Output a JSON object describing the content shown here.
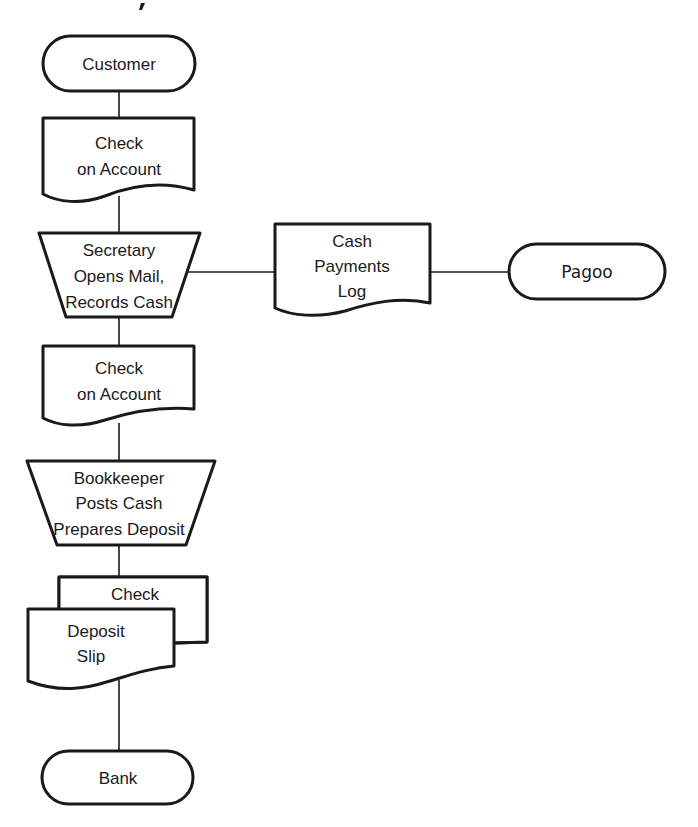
{
  "diagram": {
    "type": "flowchart",
    "nodes": [
      {
        "id": "customer",
        "shape": "terminator",
        "lines": [
          "Customer"
        ]
      },
      {
        "id": "check1",
        "shape": "document",
        "lines": [
          "Check",
          "on Account"
        ]
      },
      {
        "id": "secretary",
        "shape": "manual-operation",
        "lines": [
          "Secretary",
          "Opens Mail,",
          "Records Cash"
        ]
      },
      {
        "id": "cashlog",
        "shape": "document",
        "lines": [
          "Cash",
          "Payments",
          "Log"
        ]
      },
      {
        "id": "pagoo",
        "shape": "terminator",
        "lines": [
          "Pagoo"
        ]
      },
      {
        "id": "check2",
        "shape": "document",
        "lines": [
          "Check",
          "on Account"
        ]
      },
      {
        "id": "bookkeeper",
        "shape": "manual-operation",
        "lines": [
          "Bookkeeper",
          "Posts Cash",
          "Prepares Deposit"
        ]
      },
      {
        "id": "check3",
        "shape": "document-back",
        "lines": [
          "Check"
        ]
      },
      {
        "id": "depositslip",
        "shape": "document-front",
        "lines": [
          "Deposit",
          "Slip"
        ]
      },
      {
        "id": "bank",
        "shape": "terminator",
        "lines": [
          "Bank"
        ]
      }
    ],
    "edges": [
      {
        "from": "customer",
        "to": "check1"
      },
      {
        "from": "check1",
        "to": "secretary"
      },
      {
        "from": "secretary",
        "to": "cashlog"
      },
      {
        "from": "cashlog",
        "to": "pagoo"
      },
      {
        "from": "secretary",
        "to": "check2"
      },
      {
        "from": "check2",
        "to": "bookkeeper"
      },
      {
        "from": "bookkeeper",
        "to": "check3"
      },
      {
        "from": "depositslip",
        "to": "bank"
      }
    ]
  }
}
